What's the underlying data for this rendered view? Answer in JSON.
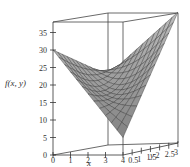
{
  "chart_data": {
    "type": "surface3d",
    "title": "",
    "xlabel": "x",
    "ylabel": "y",
    "zlabel": "f(x, y)",
    "xlim": [
      0,
      4
    ],
    "ylim": [
      0,
      3
    ],
    "zlim": [
      0,
      38
    ],
    "x_ticks": [
      "0",
      "1",
      "2",
      "3",
      "4"
    ],
    "y_ticks": [
      "0.5",
      "1",
      "1.5",
      "2",
      "2.5",
      "3"
    ],
    "z_ticks": [
      "0",
      "5",
      "10",
      "15",
      "20",
      "25",
      "30",
      "35"
    ],
    "surface": {
      "description": "Saddle-shaped surface, high at corners (x=0,y=0 ~30; x=4,y=3 ~38), dipping low near (x=4,y=0) ~5",
      "corner_values": {
        "x0_y0": 30,
        "x4_y0": 5,
        "x0_y3": 20,
        "x4_y3": 38
      }
    },
    "grid": false,
    "box": true
  },
  "axes": {
    "z_label": "f(x, y)",
    "x_label": "x",
    "y_label": "y"
  }
}
